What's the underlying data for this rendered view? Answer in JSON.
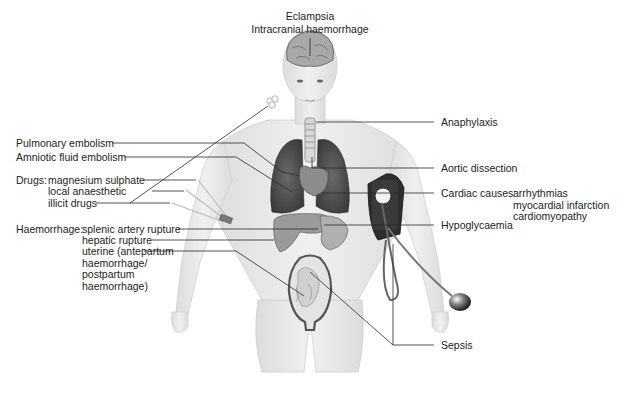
{
  "diagram": {
    "labels": {
      "top": {
        "line1": "Eclampsia",
        "line2": "Intracranial haemorrhage"
      },
      "left": {
        "pulmonary_embolism": "Pulmonary embolism",
        "amniotic_fluid_embolism": "Amniotic fluid embolism",
        "drugs_heading": "Drugs:",
        "drugs": [
          "magnesium sulphate",
          "local anaesthetic",
          "illicit drugs"
        ],
        "haemorrhage_heading": "Haemorrhage:",
        "haemorrhage": [
          "splenic artery rupture",
          "hepatic rupture",
          "uterine (antepartum",
          "haemorrhage/",
          "postpartum",
          "haemorrhage)"
        ]
      },
      "right": {
        "anaphylaxis": "Anaphylaxis",
        "aortic_dissection": "Aortic dissection",
        "cardiac_heading": "Cardiac causes:",
        "cardiac": [
          "arrhythmias",
          "myocardial infarction",
          "cardiomyopathy"
        ],
        "hypoglycaemia": "Hypoglycaemia",
        "sepsis": "Sepsis"
      }
    },
    "colors": {
      "skin": "#e8e8e8",
      "skin_shade": "#d4d4d4",
      "organ_dark": "#4a4a4a",
      "organ_mid": "#8a8a8a",
      "organ_light": "#b5b5b5",
      "leader_line": "#333333",
      "cuff": "#2b2b2b"
    }
  }
}
